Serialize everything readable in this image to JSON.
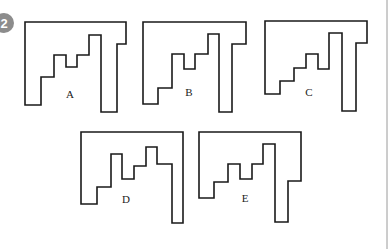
{
  "question": {
    "number": "2",
    "badge_color": "#8c8c8c"
  },
  "figures": [
    {
      "id": "A",
      "label": "A",
      "label_pos": [
        70,
        98
      ],
      "points": [
        [
          25,
          22
        ],
        [
          126,
          22
        ],
        [
          126,
          44
        ],
        [
          117,
          44
        ],
        [
          117,
          112
        ],
        [
          101,
          112
        ],
        [
          101,
          35
        ],
        [
          89,
          35
        ],
        [
          89,
          55
        ],
        [
          77,
          55
        ],
        [
          77,
          67
        ],
        [
          66,
          67
        ],
        [
          66,
          55
        ],
        [
          54,
          55
        ],
        [
          54,
          77
        ],
        [
          41,
          77
        ],
        [
          41,
          105
        ],
        [
          25,
          105
        ]
      ]
    },
    {
      "id": "B",
      "label": "B",
      "label_pos": [
        189,
        96
      ],
      "points": [
        [
          143,
          22
        ],
        [
          246,
          22
        ],
        [
          246,
          44
        ],
        [
          232,
          44
        ],
        [
          232,
          112
        ],
        [
          219,
          112
        ],
        [
          219,
          34
        ],
        [
          208,
          34
        ],
        [
          208,
          54
        ],
        [
          195,
          54
        ],
        [
          195,
          69
        ],
        [
          184,
          69
        ],
        [
          184,
          54
        ],
        [
          172,
          54
        ],
        [
          172,
          88
        ],
        [
          158,
          88
        ],
        [
          158,
          104
        ],
        [
          143,
          104
        ]
      ]
    },
    {
      "id": "C",
      "label": "C",
      "label_pos": [
        309,
        96
      ],
      "points": [
        [
          265,
          21
        ],
        [
          367,
          21
        ],
        [
          367,
          43
        ],
        [
          356,
          43
        ],
        [
          356,
          111
        ],
        [
          342,
          111
        ],
        [
          342,
          33
        ],
        [
          329,
          33
        ],
        [
          329,
          69
        ],
        [
          318,
          69
        ],
        [
          318,
          54
        ],
        [
          306,
          54
        ],
        [
          306,
          68
        ],
        [
          294,
          68
        ],
        [
          294,
          81
        ],
        [
          280,
          81
        ],
        [
          280,
          94
        ],
        [
          265,
          94
        ]
      ]
    },
    {
      "id": "D",
      "label": "D",
      "label_pos": [
        126,
        203
      ],
      "points": [
        [
          81,
          132
        ],
        [
          183,
          132
        ],
        [
          183,
          223
        ],
        [
          172,
          223
        ],
        [
          172,
          164
        ],
        [
          157,
          164
        ],
        [
          157,
          147
        ],
        [
          146,
          147
        ],
        [
          146,
          166
        ],
        [
          134,
          166
        ],
        [
          134,
          179
        ],
        [
          122,
          179
        ],
        [
          122,
          154
        ],
        [
          111,
          154
        ],
        [
          111,
          187
        ],
        [
          97,
          187
        ],
        [
          97,
          204
        ],
        [
          81,
          204
        ]
      ]
    },
    {
      "id": "E",
      "label": "E",
      "label_pos": [
        245,
        202
      ],
      "points": [
        [
          199,
          132
        ],
        [
          301,
          132
        ],
        [
          301,
          181
        ],
        [
          288,
          181
        ],
        [
          288,
          222
        ],
        [
          275,
          222
        ],
        [
          275,
          144
        ],
        [
          263,
          144
        ],
        [
          263,
          164
        ],
        [
          252,
          164
        ],
        [
          252,
          179
        ],
        [
          240,
          179
        ],
        [
          240,
          164
        ],
        [
          228,
          164
        ],
        [
          228,
          182
        ],
        [
          214,
          182
        ],
        [
          214,
          198
        ],
        [
          199,
          198
        ]
      ]
    }
  ]
}
